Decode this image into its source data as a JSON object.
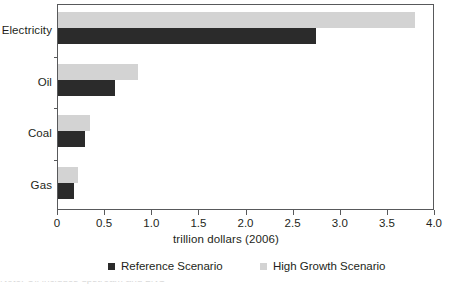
{
  "chart_data": {
    "type": "bar",
    "orientation": "horizontal",
    "title": "",
    "categories": [
      "Electricity",
      "Oil",
      "Coal",
      "Gas"
    ],
    "series": [
      {
        "name": "Reference Scenario",
        "color": "#2b2b2b",
        "values": [
          2.74,
          0.6,
          0.29,
          0.17
        ]
      },
      {
        "name": "High Growth Scenario",
        "color": "#d3d3d3",
        "values": [
          3.79,
          0.85,
          0.34,
          0.21
        ]
      }
    ],
    "xlabel": "trillion dollars (2006)",
    "ylabel": "",
    "xlim": [
      0,
      4.0
    ],
    "xticks": [
      "0",
      "0.5",
      "1.0",
      "1.5",
      "2.0",
      "2.5",
      "3.0",
      "3.5",
      "4.0"
    ],
    "xtick_values": [
      0,
      0.5,
      1.0,
      1.5,
      2.0,
      2.5,
      3.0,
      3.5,
      4.0
    ],
    "grid": false,
    "legend_position": "bottom"
  },
  "axis": {
    "x_title": "trillion dollars (2006)",
    "tick_labels": [
      "0",
      "0.5",
      "1.0",
      "1.5",
      "2.0",
      "2.5",
      "3.0",
      "3.5",
      "4.0"
    ],
    "categories": [
      "Electricity",
      "Oil",
      "Coal",
      "Gas"
    ]
  },
  "legend": {
    "items": [
      {
        "label": "Reference Scenario",
        "color": "#2b2b2b"
      },
      {
        "label": "High Growth Scenario",
        "color": "#d3d3d3"
      }
    ]
  },
  "colors": {
    "reference": "#2b2b2b",
    "high_growth": "#d3d3d3",
    "axis": "#58595b",
    "text": "#231f20",
    "background": "#ffffff"
  },
  "caption_sliver": "Note: Oil includes upstream and LNG"
}
